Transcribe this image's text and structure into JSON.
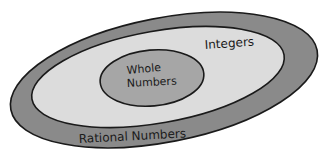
{
  "diagram": {
    "type": "nested-venn",
    "regions": [
      {
        "id": "rational",
        "label": "Rational Numbers",
        "fill": "#8a8a8a"
      },
      {
        "id": "integers",
        "label": "Integers",
        "fill": "#dcdcdc"
      },
      {
        "id": "whole",
        "label": "Whole Numbers",
        "label_line1": "Whole",
        "label_line2": "Numbers",
        "fill": "#a6a6a6"
      }
    ],
    "stroke": "#1a1a1a"
  }
}
